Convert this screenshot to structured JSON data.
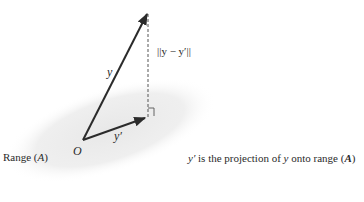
{
  "diagram": {
    "vectors": {
      "y": {
        "label": "y",
        "from": [
          83,
          140
        ],
        "to": [
          148,
          12
        ]
      },
      "y_prime": {
        "label": "y′",
        "from": [
          83,
          140
        ],
        "to": [
          147,
          117
        ]
      }
    },
    "error_segment": {
      "label": "||y − y′||",
      "style": "dashed"
    },
    "origin_label": "O",
    "plane_label_prefix": "Range (",
    "plane_label_var": "A",
    "plane_label_suffix": ")",
    "caption": {
      "prefix": "y′",
      "middle": " is the projection of ",
      "var": "y",
      "after": " onto range (",
      "bold_var": "A",
      "end": ")"
    },
    "colors": {
      "plane": "#ececec",
      "vector": "#2b2b2b",
      "dashed": "#555555"
    }
  }
}
